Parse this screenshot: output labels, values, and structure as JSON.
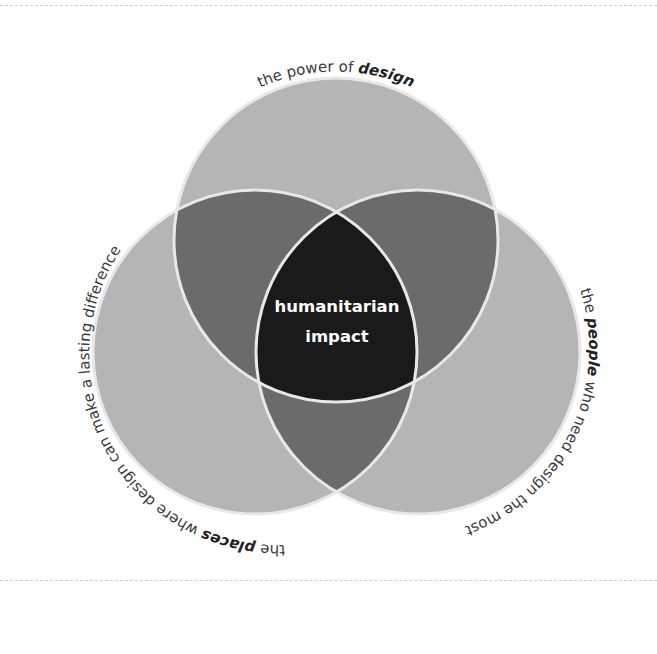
{
  "diagram": {
    "type": "venn",
    "colors": {
      "single": "#b5b5b5",
      "pair": "#6b6b6b",
      "center": "#1a1a1a",
      "outline": "#e8e8e8",
      "label": "#3a3a3a"
    },
    "circles": [
      {
        "id": "design",
        "label_prefix": "the power of ",
        "label_emphasis": "design",
        "label_suffix": ""
      },
      {
        "id": "people",
        "label_prefix": "the ",
        "label_emphasis": "people",
        "label_suffix": " who need design the most"
      },
      {
        "id": "places",
        "label_prefix": "the ",
        "label_emphasis": "places",
        "label_suffix": " where design can make a lasting difference"
      }
    ],
    "center": {
      "line1": "humanitarian",
      "line2": "impact"
    }
  }
}
